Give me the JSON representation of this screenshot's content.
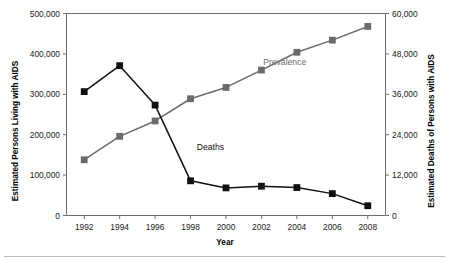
{
  "chart_data": {
    "type": "line",
    "title": "",
    "xlabel": "Year",
    "ylabel": "Estimated Persons Living with AIDS",
    "y2label": "Estimated Deaths of Persons with AIDS",
    "x": [
      1992,
      1994,
      1996,
      1998,
      2000,
      2002,
      2004,
      2006,
      2008
    ],
    "xtick_labels": [
      "1992",
      "1994",
      "1996",
      "1998",
      "2000",
      "2002",
      "2004",
      "2006",
      "2008"
    ],
    "xlim": [
      1991,
      2009
    ],
    "ylim": [
      0,
      500000
    ],
    "ytick_labels": [
      "0",
      "100,000",
      "200,000",
      "300,000",
      "400,000",
      "500,000"
    ],
    "ytick_values": [
      0,
      100000,
      200000,
      300000,
      400000,
      500000
    ],
    "y2lim": [
      0,
      60000
    ],
    "y2tick_labels": [
      "0",
      "12,000",
      "24,000",
      "36,000",
      "48,000",
      "60,000"
    ],
    "y2tick_values": [
      0,
      12000,
      24000,
      36000,
      48000,
      60000
    ],
    "grid": false,
    "legend": "inline-annotations",
    "series": [
      {
        "name": "Prevalence",
        "axis": "left",
        "color": "#6b6b6b",
        "marker": "square",
        "label_text": "Prevalence",
        "label_x": 2002.1,
        "label_y": 372000,
        "values": [
          138000,
          196000,
          234000,
          289000,
          317000,
          360000,
          404000,
          434000,
          468000
        ]
      },
      {
        "name": "Deaths",
        "axis": "right",
        "color": "#111111",
        "marker": "square",
        "label_text": "Deaths",
        "label_x": 1998.35,
        "label_y": 19600,
        "values": [
          36800,
          44500,
          32800,
          10300,
          8200,
          8700,
          8300,
          6500,
          2900
        ]
      }
    ]
  }
}
